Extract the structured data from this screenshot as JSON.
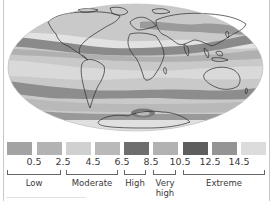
{
  "map": {
    "title": "World UV index map",
    "projection": "ellipse",
    "ocean_color": "#c4c4c4",
    "land_outline_color": "#2a2a2a"
  },
  "legend": {
    "swatches": [
      {
        "color": "#a3a3a3",
        "x": 7
      },
      {
        "color": "#b3b3b3",
        "x": 37
      },
      {
        "color": "#d0d0d0",
        "x": 66
      },
      {
        "color": "#b9b9b9",
        "x": 95
      },
      {
        "color": "#6e6e6e",
        "x": 124
      },
      {
        "color": "#b2b2b2",
        "x": 153
      },
      {
        "color": "#5e5e5e",
        "x": 183
      },
      {
        "color": "#949494",
        "x": 212
      },
      {
        "color": "#dcdcdc",
        "x": 241
      }
    ],
    "ticks": [
      {
        "label": "0.5",
        "x": 34
      },
      {
        "label": "2.5",
        "x": 63
      },
      {
        "label": "4.5",
        "x": 93
      },
      {
        "label": "6.5",
        "x": 122
      },
      {
        "label": "8.5",
        "x": 151
      },
      {
        "label": "10.5",
        "x": 180
      },
      {
        "label": "12.5",
        "x": 210
      },
      {
        "label": "14.5",
        "x": 239
      }
    ],
    "categories": [
      {
        "label": "Low",
        "label2": "",
        "left": 7,
        "width": 54
      },
      {
        "label": "Moderate",
        "label2": "",
        "left": 66,
        "width": 52
      },
      {
        "label": "High",
        "label2": "",
        "left": 124,
        "width": 22
      },
      {
        "label": "Very",
        "label2": "high",
        "left": 153,
        "width": 23
      },
      {
        "label": "Extreme",
        "label2": "",
        "left": 183,
        "width": 82
      }
    ]
  }
}
